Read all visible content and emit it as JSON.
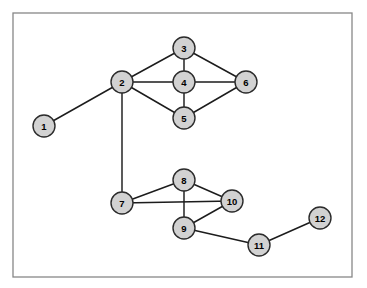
{
  "figure": {
    "width": 367,
    "height": 288,
    "background_color": "#ffffff",
    "title": "",
    "caption": ""
  },
  "frame": {
    "name": "plot-border",
    "x": 13,
    "y": 13,
    "width": 339,
    "height": 264,
    "stroke_color": "#878787",
    "stroke_width": 1.3
  },
  "style": {
    "node_fill": "#d2d2d2",
    "node_stroke": "#2b2b2b",
    "node_radius": 11,
    "node_stroke_width": 1.4,
    "edge_color": "#1c1c1c",
    "edge_width": 1.45,
    "label_color": "#000000",
    "label_size": 9.5
  },
  "chart_data": {
    "type": "diagram",
    "subtype": "node-link-graph",
    "title": "",
    "xlabel": "",
    "ylabel": "",
    "directed": false,
    "weighted": false,
    "grid": false,
    "legend": "none",
    "node_count": 12,
    "edge_count": 17,
    "nodes": [
      {
        "id": "1",
        "label": "1",
        "x": 44,
        "y": 126,
        "degree": 1
      },
      {
        "id": "2",
        "label": "2",
        "x": 122,
        "y": 82,
        "degree": 5
      },
      {
        "id": "3",
        "label": "3",
        "x": 184,
        "y": 48,
        "degree": 3
      },
      {
        "id": "4",
        "label": "4",
        "x": 184,
        "y": 82,
        "degree": 4
      },
      {
        "id": "5",
        "label": "5",
        "x": 184,
        "y": 118,
        "degree": 3
      },
      {
        "id": "6",
        "label": "6",
        "x": 246,
        "y": 82,
        "degree": 3
      },
      {
        "id": "7",
        "label": "7",
        "x": 122,
        "y": 203,
        "degree": 3
      },
      {
        "id": "8",
        "label": "8",
        "x": 184,
        "y": 180,
        "degree": 3
      },
      {
        "id": "9",
        "label": "9",
        "x": 184,
        "y": 228,
        "degree": 3
      },
      {
        "id": "10",
        "label": "10",
        "x": 232,
        "y": 201,
        "degree": 3
      },
      {
        "id": "11",
        "label": "11",
        "x": 259,
        "y": 245,
        "degree": 2
      },
      {
        "id": "12",
        "label": "12",
        "x": 320,
        "y": 218,
        "degree": 1
      }
    ],
    "edges": [
      {
        "source": "1",
        "target": "2"
      },
      {
        "source": "2",
        "target": "3"
      },
      {
        "source": "2",
        "target": "4"
      },
      {
        "source": "2",
        "target": "5"
      },
      {
        "source": "2",
        "target": "7"
      },
      {
        "source": "3",
        "target": "4"
      },
      {
        "source": "3",
        "target": "6"
      },
      {
        "source": "4",
        "target": "5"
      },
      {
        "source": "4",
        "target": "6"
      },
      {
        "source": "5",
        "target": "6"
      },
      {
        "source": "7",
        "target": "8"
      },
      {
        "source": "7",
        "target": "10"
      },
      {
        "source": "8",
        "target": "9"
      },
      {
        "source": "8",
        "target": "10"
      },
      {
        "source": "9",
        "target": "10"
      },
      {
        "source": "9",
        "target": "11"
      },
      {
        "source": "11",
        "target": "12"
      }
    ]
  }
}
